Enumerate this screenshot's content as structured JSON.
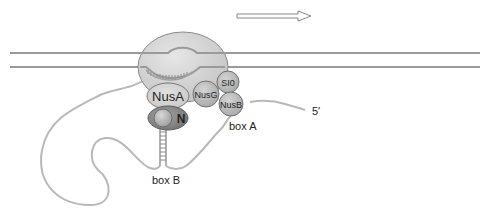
{
  "diagram": {
    "direction_arrow": "transcription-direction",
    "proteins": {
      "rnap": "",
      "nusa": "NusA",
      "nusg": "NusG",
      "s10": "SI0",
      "nusb": "NusB",
      "n": "N"
    },
    "rna_elements": {
      "box_a": "box A",
      "box_b": "box B",
      "five_prime": "5′"
    },
    "colors": {
      "dna": "#9a9a9a",
      "rna": "#b8b8b8",
      "rnap_fill": "#d6d6d6",
      "protein_fill": "#bcbcbc",
      "n_fill": "#8c8c8c",
      "outline": "#777777",
      "text": "#222222"
    }
  }
}
